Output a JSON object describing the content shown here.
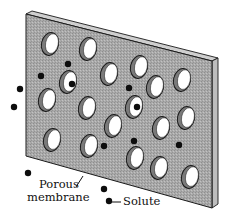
{
  "figure": {
    "colors": {
      "membrane_fill": "#a8a8a8",
      "membrane_edge": "#c9c9c9",
      "outline": "#1a1a1a",
      "hole_fill": "#ffffff",
      "hole_shadow": "#7a7a7a",
      "solute": "#0d0d0d"
    },
    "membrane": {
      "front_face": [
        [
          26,
          14
        ],
        [
          212,
          61
        ],
        [
          212,
          208
        ],
        [
          26,
          156
        ]
      ],
      "top_edge": [
        [
          26,
          14
        ],
        [
          32,
          11
        ],
        [
          218,
          58
        ],
        [
          212,
          61
        ]
      ],
      "right_edge": [
        [
          212,
          61
        ],
        [
          218,
          58
        ],
        [
          218,
          204
        ],
        [
          212,
          208
        ]
      ]
    },
    "holes": [
      {
        "cx": 50,
        "cy": 44
      },
      {
        "cx": 88,
        "cy": 49
      },
      {
        "cx": 68,
        "cy": 82
      },
      {
        "cx": 109,
        "cy": 74
      },
      {
        "cx": 139,
        "cy": 67
      },
      {
        "cx": 155,
        "cy": 87
      },
      {
        "cx": 182,
        "cy": 80
      },
      {
        "cx": 47,
        "cy": 100
      },
      {
        "cx": 87,
        "cy": 108
      },
      {
        "cx": 134,
        "cy": 107
      },
      {
        "cx": 113,
        "cy": 126
      },
      {
        "cx": 161,
        "cy": 128
      },
      {
        "cx": 186,
        "cy": 118
      },
      {
        "cx": 52,
        "cy": 140
      },
      {
        "cx": 89,
        "cy": 146
      },
      {
        "cx": 135,
        "cy": 158
      },
      {
        "cx": 159,
        "cy": 168
      },
      {
        "cx": 190,
        "cy": 177
      }
    ],
    "solutes": [
      {
        "cx": 68,
        "cy": 64
      },
      {
        "cx": 41,
        "cy": 76
      },
      {
        "cx": 20,
        "cy": 89
      },
      {
        "cx": 14,
        "cy": 107
      },
      {
        "cx": 72,
        "cy": 84
      },
      {
        "cx": 129,
        "cy": 88
      },
      {
        "cx": 137,
        "cy": 107
      },
      {
        "cx": 104,
        "cy": 146
      },
      {
        "cx": 134,
        "cy": 141
      },
      {
        "cx": 179,
        "cy": 145
      },
      {
        "cx": 28,
        "cy": 173
      },
      {
        "cx": 104,
        "cy": 189
      },
      {
        "cx": 109,
        "cy": 201
      }
    ],
    "labels": {
      "membrane_line1": "Porous",
      "membrane_line2": "membrane",
      "solute": "Solute"
    }
  }
}
